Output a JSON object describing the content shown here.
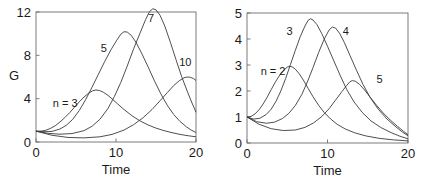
{
  "figure": {
    "background": "#ffffff",
    "curve_color": "#3b3b3b",
    "axis_color": "#6e6e6e",
    "text_color": "#1a1a1a"
  },
  "chart_data": [
    {
      "type": "line",
      "panel": "left",
      "title": "",
      "xlabel": "Time",
      "ylabel": "G",
      "xlim": [
        0,
        20
      ],
      "ylim": [
        0,
        12
      ],
      "xticks": [
        0,
        10,
        20
      ],
      "xticklabels": [
        "0",
        "10",
        "20"
      ],
      "yticks": [
        0,
        4,
        8,
        12
      ],
      "yticklabels": [
        "0",
        "4",
        "8",
        "12"
      ],
      "grid": false,
      "legend": "inline-annotations",
      "series": [
        {
          "name": "n = 3",
          "label": "n = 3",
          "label_x": 2.1,
          "label_y": 3.25,
          "peak_x": 7.5,
          "peak_y": 4.8,
          "start_y": 1.0,
          "end_y": 0.35,
          "points": [
            [
              0.0,
              1.0
            ],
            [
              0.6,
              1.0
            ],
            [
              1.2,
              1.08
            ],
            [
              1.8,
              1.25
            ],
            [
              2.4,
              1.5
            ],
            [
              3.0,
              1.85
            ],
            [
              3.6,
              2.25
            ],
            [
              4.2,
              2.7
            ],
            [
              4.8,
              3.2
            ],
            [
              5.4,
              3.7
            ],
            [
              6.0,
              4.15
            ],
            [
              6.6,
              4.52
            ],
            [
              7.1,
              4.73
            ],
            [
              7.5,
              4.8
            ],
            [
              7.9,
              4.76
            ],
            [
              8.4,
              4.6
            ],
            [
              9.0,
              4.3
            ],
            [
              9.6,
              3.92
            ],
            [
              10.2,
              3.52
            ],
            [
              11.0,
              3.0
            ],
            [
              12.0,
              2.42
            ],
            [
              13.0,
              1.95
            ],
            [
              14.0,
              1.58
            ],
            [
              15.0,
              1.28
            ],
            [
              16.0,
              1.05
            ],
            [
              17.0,
              0.86
            ],
            [
              18.0,
              0.7
            ],
            [
              19.0,
              0.58
            ],
            [
              20.0,
              0.48
            ]
          ]
        },
        {
          "name": "5",
          "label": "5",
          "label_x": 8.1,
          "label_y": 8.3,
          "peak_x": 11.0,
          "peak_y": 10.2,
          "start_y": 1.0,
          "end_y": 0.25,
          "points": [
            [
              0.0,
              1.0
            ],
            [
              1.0,
              0.95
            ],
            [
              2.0,
              0.98
            ],
            [
              3.0,
              1.2
            ],
            [
              3.8,
              1.55
            ],
            [
              4.6,
              2.1
            ],
            [
              5.4,
              2.9
            ],
            [
              6.2,
              3.9
            ],
            [
              7.0,
              5.05
            ],
            [
              7.8,
              6.25
            ],
            [
              8.6,
              7.45
            ],
            [
              9.4,
              8.55
            ],
            [
              10.1,
              9.4
            ],
            [
              10.6,
              9.95
            ],
            [
              11.0,
              10.18
            ],
            [
              11.4,
              10.15
            ],
            [
              11.9,
              9.85
            ],
            [
              12.5,
              9.2
            ],
            [
              13.2,
              8.2
            ],
            [
              14.0,
              6.95
            ],
            [
              14.8,
              5.65
            ],
            [
              15.6,
              4.45
            ],
            [
              16.4,
              3.4
            ],
            [
              17.2,
              2.55
            ],
            [
              18.0,
              1.9
            ],
            [
              18.8,
              1.4
            ],
            [
              19.4,
              1.1
            ],
            [
              20.0,
              0.88
            ]
          ]
        },
        {
          "name": "7",
          "label": "7",
          "label_x": 14.0,
          "label_y": 11.1,
          "peak_x": 14.4,
          "peak_y": 12.3,
          "start_y": 1.0,
          "end_y": 2.7,
          "points": [
            [
              0.0,
              1.0
            ],
            [
              1.5,
              0.8
            ],
            [
              3.0,
              0.72
            ],
            [
              4.5,
              0.78
            ],
            [
              6.0,
              1.05
            ],
            [
              7.0,
              1.45
            ],
            [
              8.0,
              2.1
            ],
            [
              9.0,
              3.1
            ],
            [
              9.8,
              4.2
            ],
            [
              10.6,
              5.5
            ],
            [
              11.4,
              7.0
            ],
            [
              12.2,
              8.6
            ],
            [
              13.0,
              10.05
            ],
            [
              13.7,
              11.3
            ],
            [
              14.2,
              12.05
            ],
            [
              14.6,
              12.3
            ],
            [
              15.0,
              12.2
            ],
            [
              15.5,
              11.7
            ],
            [
              16.1,
              10.7
            ],
            [
              16.8,
              9.2
            ],
            [
              17.5,
              7.6
            ],
            [
              18.2,
              6.05
            ],
            [
              18.9,
              4.7
            ],
            [
              19.5,
              3.6
            ],
            [
              20.0,
              2.75
            ]
          ]
        },
        {
          "name": "10",
          "label": "10",
          "label_x": 17.9,
          "label_y": 7.0,
          "peak_x": 18.9,
          "peak_y": 6.0,
          "start_y": 1.0,
          "end_y": 5.65,
          "points": [
            [
              0.0,
              1.0
            ],
            [
              2.0,
              0.62
            ],
            [
              4.0,
              0.42
            ],
            [
              6.0,
              0.38
            ],
            [
              8.0,
              0.48
            ],
            [
              9.5,
              0.7
            ],
            [
              11.0,
              1.1
            ],
            [
              12.2,
              1.6
            ],
            [
              13.4,
              2.25
            ],
            [
              14.5,
              3.0
            ],
            [
              15.5,
              3.8
            ],
            [
              16.4,
              4.55
            ],
            [
              17.2,
              5.2
            ],
            [
              17.9,
              5.65
            ],
            [
              18.5,
              5.93
            ],
            [
              18.9,
              6.0
            ],
            [
              19.3,
              5.97
            ],
            [
              19.7,
              5.85
            ],
            [
              20.0,
              5.68
            ]
          ]
        }
      ]
    },
    {
      "type": "line",
      "panel": "right",
      "title": "",
      "xlabel": "Time",
      "ylabel": "",
      "xlim": [
        0,
        20
      ],
      "ylim": [
        0,
        5
      ],
      "xticks": [
        0,
        10,
        20
      ],
      "xticklabels": [
        "0",
        "10",
        "20"
      ],
      "yticks": [
        0,
        1,
        2,
        3,
        4,
        5
      ],
      "yticklabels": [
        "0",
        "1",
        "2",
        "3",
        "4",
        "5"
      ],
      "grid": false,
      "legend": "inline-annotations",
      "series": [
        {
          "name": "n = 2",
          "label": "n = 2",
          "label_x": 1.7,
          "label_y": 2.62,
          "peak_x": 5.3,
          "peak_y": 2.95,
          "start_y": 1.0,
          "end_y": 0.08,
          "points": [
            [
              0.0,
              1.0
            ],
            [
              0.5,
              1.02
            ],
            [
              1.0,
              1.12
            ],
            [
              1.5,
              1.28
            ],
            [
              2.0,
              1.5
            ],
            [
              2.5,
              1.76
            ],
            [
              3.0,
              2.05
            ],
            [
              3.5,
              2.33
            ],
            [
              4.0,
              2.58
            ],
            [
              4.5,
              2.78
            ],
            [
              5.0,
              2.92
            ],
            [
              5.3,
              2.95
            ],
            [
              5.6,
              2.93
            ],
            [
              6.0,
              2.84
            ],
            [
              6.5,
              2.66
            ],
            [
              7.0,
              2.42
            ],
            [
              7.6,
              2.1
            ],
            [
              8.2,
              1.78
            ],
            [
              8.9,
              1.45
            ],
            [
              9.6,
              1.17
            ],
            [
              10.4,
              0.92
            ],
            [
              11.2,
              0.72
            ],
            [
              12.2,
              0.54
            ],
            [
              13.4,
              0.39
            ],
            [
              14.8,
              0.27
            ],
            [
              16.4,
              0.18
            ],
            [
              18.2,
              0.12
            ],
            [
              20.0,
              0.08
            ]
          ]
        },
        {
          "name": "3",
          "label": "3",
          "label_x": 4.9,
          "label_y": 4.15,
          "peak_x": 7.8,
          "peak_y": 4.78,
          "start_y": 1.0,
          "end_y": 0.13,
          "points": [
            [
              0.0,
              1.0
            ],
            [
              0.8,
              0.92
            ],
            [
              1.6,
              0.95
            ],
            [
              2.4,
              1.1
            ],
            [
              3.0,
              1.3
            ],
            [
              3.6,
              1.6
            ],
            [
              4.2,
              2.0
            ],
            [
              4.8,
              2.48
            ],
            [
              5.4,
              3.02
            ],
            [
              6.0,
              3.56
            ],
            [
              6.6,
              4.08
            ],
            [
              7.2,
              4.5
            ],
            [
              7.6,
              4.72
            ],
            [
              7.9,
              4.78
            ],
            [
              8.2,
              4.73
            ],
            [
              8.7,
              4.55
            ],
            [
              9.3,
              4.2
            ],
            [
              10.0,
              3.72
            ],
            [
              10.8,
              3.15
            ],
            [
              11.6,
              2.58
            ],
            [
              12.4,
              2.05
            ],
            [
              13.3,
              1.58
            ],
            [
              14.3,
              1.18
            ],
            [
              15.4,
              0.85
            ],
            [
              16.6,
              0.6
            ],
            [
              17.9,
              0.4
            ],
            [
              19.0,
              0.26
            ],
            [
              20.0,
              0.16
            ]
          ]
        },
        {
          "name": "4",
          "label": "4",
          "label_x": 11.9,
          "label_y": 4.15,
          "peak_x": 10.5,
          "peak_y": 4.46,
          "start_y": 1.0,
          "end_y": 0.1,
          "points": [
            [
              0.0,
              1.0
            ],
            [
              1.2,
              0.82
            ],
            [
              2.4,
              0.76
            ],
            [
              3.4,
              0.8
            ],
            [
              4.4,
              0.94
            ],
            [
              5.2,
              1.14
            ],
            [
              6.0,
              1.44
            ],
            [
              6.8,
              1.86
            ],
            [
              7.5,
              2.35
            ],
            [
              8.2,
              2.9
            ],
            [
              8.9,
              3.48
            ],
            [
              9.6,
              4.0
            ],
            [
              10.2,
              4.35
            ],
            [
              10.6,
              4.46
            ],
            [
              11.0,
              4.42
            ],
            [
              11.5,
              4.22
            ],
            [
              12.1,
              3.86
            ],
            [
              12.8,
              3.36
            ],
            [
              13.6,
              2.8
            ],
            [
              14.4,
              2.26
            ],
            [
              15.3,
              1.75
            ],
            [
              16.3,
              1.3
            ],
            [
              17.4,
              0.92
            ],
            [
              18.5,
              0.62
            ],
            [
              19.3,
              0.42
            ],
            [
              20.0,
              0.28
            ]
          ]
        },
        {
          "name": "5",
          "label": "5",
          "label_x": 16.1,
          "label_y": 2.3,
          "peak_x": 13.0,
          "peak_y": 2.4,
          "start_y": 1.0,
          "end_y": 0.06,
          "points": [
            [
              0.0,
              1.0
            ],
            [
              1.5,
              0.72
            ],
            [
              3.0,
              0.55
            ],
            [
              4.5,
              0.48
            ],
            [
              6.0,
              0.5
            ],
            [
              7.2,
              0.6
            ],
            [
              8.3,
              0.78
            ],
            [
              9.3,
              1.02
            ],
            [
              10.2,
              1.32
            ],
            [
              11.0,
              1.65
            ],
            [
              11.8,
              1.98
            ],
            [
              12.4,
              2.22
            ],
            [
              12.8,
              2.36
            ],
            [
              13.1,
              2.4
            ],
            [
              13.5,
              2.37
            ],
            [
              14.0,
              2.25
            ],
            [
              14.6,
              2.04
            ],
            [
              15.3,
              1.76
            ],
            [
              16.1,
              1.45
            ],
            [
              16.9,
              1.16
            ],
            [
              17.8,
              0.88
            ],
            [
              18.7,
              0.64
            ],
            [
              19.4,
              0.46
            ],
            [
              20.0,
              0.32
            ]
          ]
        }
      ]
    }
  ]
}
